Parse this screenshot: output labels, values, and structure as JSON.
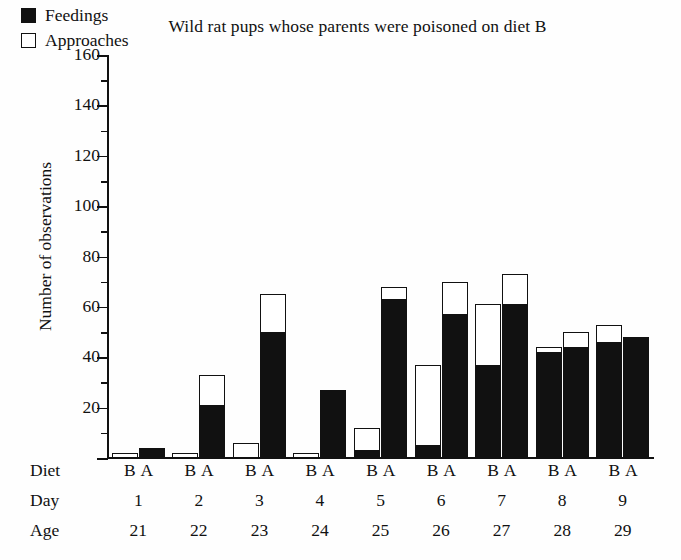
{
  "chart_data": {
    "type": "bar",
    "title": "Wild rat pups whose parents were poisoned on diet B",
    "xlabel": "",
    "ylabel": "Number of observations",
    "ylim": [
      0,
      160
    ],
    "ytick_step": 20,
    "yminor_step": 10,
    "grid": false,
    "legend_position": "top-left-inside",
    "stacked": true,
    "legend": [
      {
        "label": "Feedings",
        "swatch": "filled-black",
        "color": "#111111"
      },
      {
        "label": "Approaches",
        "swatch": "open-white",
        "color": "#ffffff"
      }
    ],
    "row_labels": {
      "diet": "Diet",
      "day": "Day",
      "age": "Age"
    },
    "diet_symbols": {
      "b": "B",
      "a": "A"
    },
    "categories": [
      "1",
      "2",
      "3",
      "4",
      "5",
      "6",
      "7",
      "8",
      "9"
    ],
    "ages": [
      "21",
      "22",
      "23",
      "24",
      "25",
      "26",
      "27",
      "28",
      "29"
    ],
    "groups": [
      {
        "day": "1",
        "age": "21",
        "bars": [
          {
            "diet": "B",
            "feedings": 0,
            "total": 2
          },
          {
            "diet": "A",
            "feedings": 4,
            "total": 4
          }
        ]
      },
      {
        "day": "2",
        "age": "22",
        "bars": [
          {
            "diet": "B",
            "feedings": 0,
            "total": 2
          },
          {
            "diet": "A",
            "feedings": 21,
            "total": 33
          }
        ]
      },
      {
        "day": "3",
        "age": "23",
        "bars": [
          {
            "diet": "B",
            "feedings": 0,
            "total": 6
          },
          {
            "diet": "A",
            "feedings": 50,
            "total": 65
          }
        ]
      },
      {
        "day": "4",
        "age": "24",
        "bars": [
          {
            "diet": "B",
            "feedings": 0,
            "total": 2
          },
          {
            "diet": "A",
            "feedings": 27,
            "total": 27
          }
        ]
      },
      {
        "day": "5",
        "age": "25",
        "bars": [
          {
            "diet": "B",
            "feedings": 3,
            "total": 12
          },
          {
            "diet": "A",
            "feedings": 63,
            "total": 68
          }
        ]
      },
      {
        "day": "6",
        "age": "26",
        "bars": [
          {
            "diet": "B",
            "feedings": 5,
            "total": 37
          },
          {
            "diet": "A",
            "feedings": 57,
            "total": 70
          }
        ]
      },
      {
        "day": "7",
        "age": "27",
        "bars": [
          {
            "diet": "B",
            "feedings": 37,
            "total": 61
          },
          {
            "diet": "A",
            "feedings": 61,
            "total": 73
          }
        ]
      },
      {
        "day": "8",
        "age": "28",
        "bars": [
          {
            "diet": "B",
            "feedings": 42,
            "total": 44
          },
          {
            "diet": "A",
            "feedings": 44,
            "total": 50
          }
        ]
      },
      {
        "day": "9",
        "age": "29",
        "bars": [
          {
            "diet": "B",
            "feedings": 46,
            "total": 53
          },
          {
            "diet": "A",
            "feedings": 48,
            "total": 48
          }
        ]
      }
    ],
    "ytick_labels": [
      "0",
      "20",
      "40",
      "60",
      "80",
      "100",
      "120",
      "140",
      "160"
    ]
  }
}
